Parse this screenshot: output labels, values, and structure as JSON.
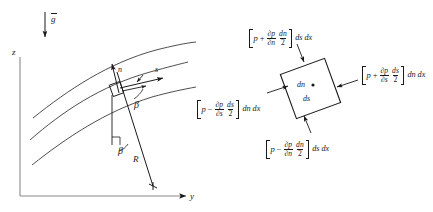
{
  "figure": {
    "left_diagram": {
      "gravity_label": "g",
      "gravity_vector_name": "gravity-arrow",
      "axis_z": "z",
      "axis_y": "y",
      "normal_label": "n",
      "streamwise_label": "s",
      "angle_upper": "β",
      "angle_lower": "β",
      "radius_label": "R",
      "streamline_count": 3
    },
    "right_diagram": {
      "element_width_label": "dn",
      "element_height_label": "ds",
      "top_force": {
        "p": "p",
        "op": "+",
        "num": "∂p",
        "den": "∂n",
        "frac2_num": "dn",
        "frac2_den": "2",
        "suffix": "ds dx"
      },
      "right_force": {
        "p": "p",
        "op": "+",
        "num": "∂p",
        "den": "∂s",
        "frac2_num": "ds",
        "frac2_den": "2",
        "suffix": "dn dx"
      },
      "left_force": {
        "p": "p",
        "op": "−",
        "num": "∂p",
        "den": "∂s",
        "frac2_num": "ds",
        "frac2_den": "2",
        "suffix": "dn dx"
      },
      "bottom_force": {
        "p": "p",
        "op": "−",
        "num": "∂p",
        "den": "∂n",
        "frac2_num": "dn",
        "frac2_den": "2",
        "suffix": "ds dx"
      }
    },
    "colors": {
      "ink": "#1a1a1a",
      "background": "#ffffff"
    }
  }
}
